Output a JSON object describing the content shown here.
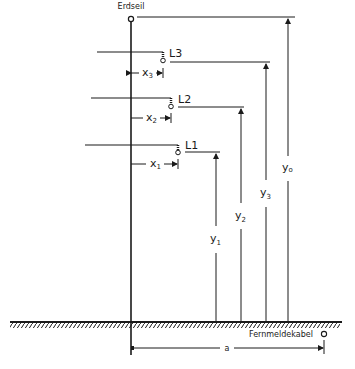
{
  "diagram": {
    "labels": {
      "earth_wire": "Erdseil",
      "telecom_cable": "Fernmeldekabel",
      "conductor_l1": "L1",
      "conductor_l2": "L2",
      "conductor_l3": "L3"
    },
    "dimensions": {
      "x1": {
        "base": "x",
        "sub": "1"
      },
      "x2": {
        "base": "x",
        "sub": "2"
      },
      "x3": {
        "base": "x",
        "sub": "3"
      },
      "y1": {
        "base": "y",
        "sub": "1"
      },
      "y2": {
        "base": "y",
        "sub": "2"
      },
      "y3": {
        "base": "y",
        "sub": "3"
      },
      "yo": {
        "base": "y",
        "sub": "o"
      },
      "a": "a"
    },
    "colors": {
      "line": "#1a1a1a",
      "background": "#ffffff"
    }
  }
}
